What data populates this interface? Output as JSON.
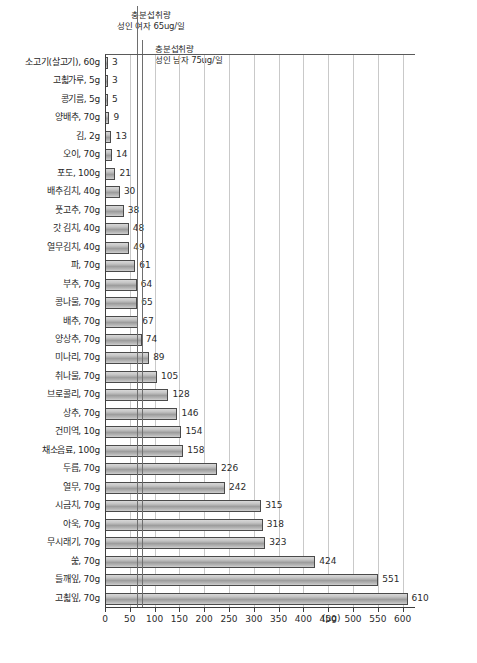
{
  "chart_data": {
    "type": "bar",
    "orientation": "horizontal",
    "title": "",
    "subtitle": "",
    "xlabel": "(µg)",
    "ylabel": "",
    "xlim": [
      0,
      625
    ],
    "grid": true,
    "legend_position": "none",
    "tick_values": [
      0,
      50,
      100,
      150,
      200,
      250,
      300,
      350,
      400,
      450,
      500,
      550,
      600
    ],
    "tick_labels": [
      "0",
      "50",
      "100",
      "150",
      "200",
      "250",
      "300",
      "350",
      "400",
      "450",
      "500",
      "550",
      "600"
    ],
    "unit_label": "(µg)",
    "categories": [
      "소고기(살고기), 60g",
      "고쵧가루, 5g",
      "콩기름, 5g",
      "양배추, 70g",
      "김, 2g",
      "오이, 70g",
      "포도, 100g",
      "배추김치, 40g",
      "풋고추, 70g",
      "갓 김치, 40g",
      "열무김치, 40g",
      "파, 70g",
      "부추, 70g",
      "콩나물, 70g",
      "배추, 70g",
      "양상추, 70g",
      "미나리, 70g",
      "취나물, 70g",
      "브로콜리, 70g",
      "상추, 70g",
      "건미역, 10g",
      "채소음료, 100g",
      "두릅, 70g",
      "열무, 70g",
      "시금치, 70g",
      "아욱, 70g",
      "무시래기, 70g",
      "쑱, 70g",
      "들깨잎, 70g",
      "고쵧잎, 70g"
    ],
    "values": [
      3,
      3,
      5,
      9,
      13,
      14,
      21,
      30,
      38,
      48,
      49,
      61,
      64,
      65,
      67,
      74,
      89,
      105,
      128,
      146,
      154,
      158,
      226,
      242,
      315,
      318,
      323,
      424,
      551,
      610
    ],
    "reference_lines": [
      {
        "id": "female",
        "value": 65,
        "label_line1": "충분섭취량",
        "label_line2": "성인 여자 65ug/일"
      },
      {
        "id": "male",
        "value": 75,
        "label_line1": "충분섭취량",
        "label_line2": "성인 남자 75ug/일"
      }
    ],
    "colors": {
      "bar_fill_light": "#d8d8d8",
      "bar_fill_mid": "#9d9d9d",
      "bar_border": "#4a4a4a",
      "axis": "#3d3d3d",
      "gridline": "#c9c9c9",
      "reference_line": "#6e6e6e",
      "text": "#1f1f1f",
      "background": "#ffffff"
    }
  }
}
